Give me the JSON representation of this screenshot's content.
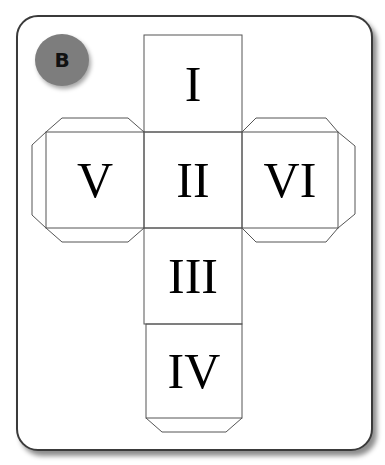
{
  "badge": {
    "label": "B",
    "color": "#7d7d7d"
  },
  "cube_net": {
    "faces": [
      {
        "id": "top",
        "label": "I"
      },
      {
        "id": "left",
        "label": "V"
      },
      {
        "id": "center",
        "label": "II"
      },
      {
        "id": "right",
        "label": "VI"
      },
      {
        "id": "lower",
        "label": "III"
      },
      {
        "id": "bottom",
        "label": "IV"
      }
    ],
    "line_color": "#555555"
  }
}
